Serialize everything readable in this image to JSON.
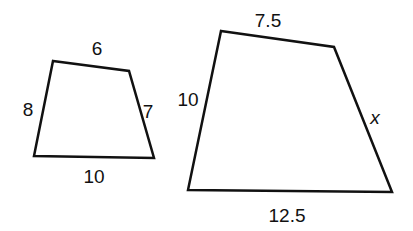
{
  "figures": [
    {
      "name": "small-quadrilateral",
      "vertices": [
        [
          53,
          61
        ],
        [
          129,
          71
        ],
        [
          154,
          158
        ],
        [
          34,
          156
        ]
      ],
      "labels": [
        {
          "side": "top",
          "text": "6",
          "x": 97,
          "y": 55
        },
        {
          "side": "right",
          "text": "7",
          "x": 148,
          "y": 118
        },
        {
          "side": "bottom",
          "text": "10",
          "x": 94,
          "y": 183
        },
        {
          "side": "left",
          "text": "8",
          "x": 28,
          "y": 116
        }
      ]
    },
    {
      "name": "large-quadrilateral",
      "vertices": [
        [
          221,
          31
        ],
        [
          334,
          47
        ],
        [
          392,
          192
        ],
        [
          188,
          190
        ]
      ],
      "labels": [
        {
          "side": "top",
          "text": "7.5",
          "x": 268,
          "y": 27
        },
        {
          "side": "right",
          "text": "x",
          "x": 375,
          "y": 124,
          "italic": true
        },
        {
          "side": "bottom",
          "text": "12.5",
          "x": 287,
          "y": 222
        },
        {
          "side": "left",
          "text": "10",
          "x": 188,
          "y": 106
        }
      ]
    }
  ],
  "stroke_color": "#111111"
}
